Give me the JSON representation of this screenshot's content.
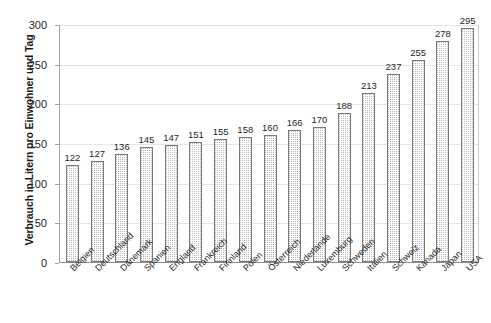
{
  "chart_data": {
    "type": "bar",
    "title": "",
    "subtitle": "",
    "xlabel": "",
    "ylabel": "Verbrauch in Litern pro Einwohner und Tag",
    "ylim": [
      0,
      300
    ],
    "ytick_values": [
      0,
      50,
      100,
      150,
      200,
      250,
      300
    ],
    "ytick_labels": [
      "0",
      "50",
      "100",
      "150",
      "200",
      "250",
      "300"
    ],
    "grid": true,
    "legend": false,
    "legend_position": "none",
    "data_labels": true,
    "categories": [
      "Belgien",
      "Deutschland",
      "Dänemark",
      "Spanien",
      "England",
      "Frankreich",
      "Finnland",
      "Polen",
      "Österreich",
      "Niederlande",
      "Luxemburg",
      "Schweden",
      "Italien",
      "Schweiz",
      "Kanada",
      "Japan",
      "USA"
    ],
    "values": [
      122,
      127,
      136,
      145,
      147,
      151,
      155,
      158,
      160,
      166,
      170,
      188,
      213,
      237,
      255,
      278,
      295
    ],
    "value_labels": [
      "122",
      "127",
      "136",
      "145",
      "147",
      "151",
      "155",
      "158",
      "160",
      "166",
      "170",
      "188",
      "213",
      "237",
      "255",
      "278",
      "295"
    ],
    "colors": {
      "bar_fill": "#ffffff",
      "bar_pattern_dot": "#b8b8b8",
      "bar_border": "#7a7a7a",
      "gridline": "#e4e4e4",
      "axis": "#8f8f8f",
      "text": "#1f1f1f",
      "background": "#ffffff"
    }
  }
}
